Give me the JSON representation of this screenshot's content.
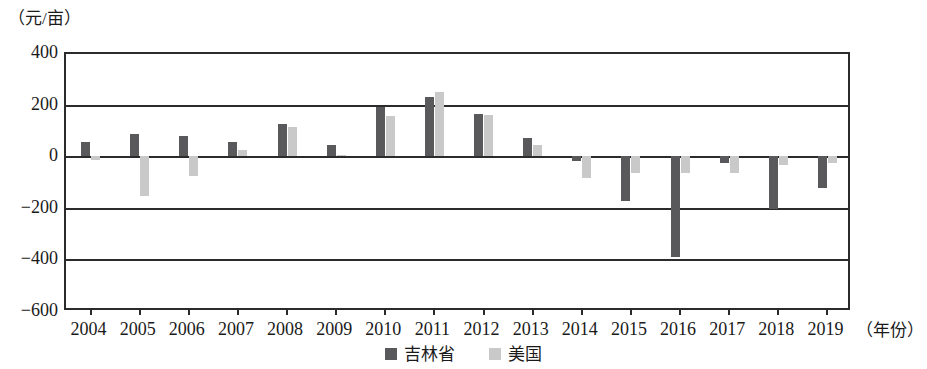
{
  "chart_data": {
    "type": "bar",
    "title": "",
    "subtitle": "",
    "ylabel": "（元/亩）",
    "xlabel": "（年份）",
    "ylim": [
      -600,
      400
    ],
    "yticks": [
      400,
      200,
      0,
      -200,
      -400,
      -600
    ],
    "ytick_labels": [
      "400",
      "200",
      "0",
      "−200",
      "−400",
      "−600"
    ],
    "grid": true,
    "grid_axis": "y",
    "legend_position": "bottom-center",
    "categories": [
      "2004",
      "2005",
      "2006",
      "2007",
      "2008",
      "2009",
      "2010",
      "2011",
      "2012",
      "2013",
      "2014",
      "2015",
      "2016",
      "2017",
      "2018",
      "2019"
    ],
    "series": [
      {
        "name": "吉林省",
        "color": "#59595b",
        "values": [
          55,
          85,
          80,
          55,
          125,
          45,
          190,
          230,
          165,
          70,
          -20,
          -175,
          -390,
          -25,
          -205,
          -125
        ]
      },
      {
        "name": "美国",
        "color": "#c9c9c9",
        "values": [
          -15,
          -155,
          -75,
          25,
          115,
          5,
          155,
          250,
          160,
          45,
          -85,
          -65,
          -65,
          -65,
          -35,
          -25
        ]
      }
    ]
  },
  "legend": {
    "items": [
      {
        "label": "吉林省",
        "swatch": "dark-gray-swatch"
      },
      {
        "label": "美国",
        "swatch": "light-gray-swatch"
      }
    ]
  }
}
